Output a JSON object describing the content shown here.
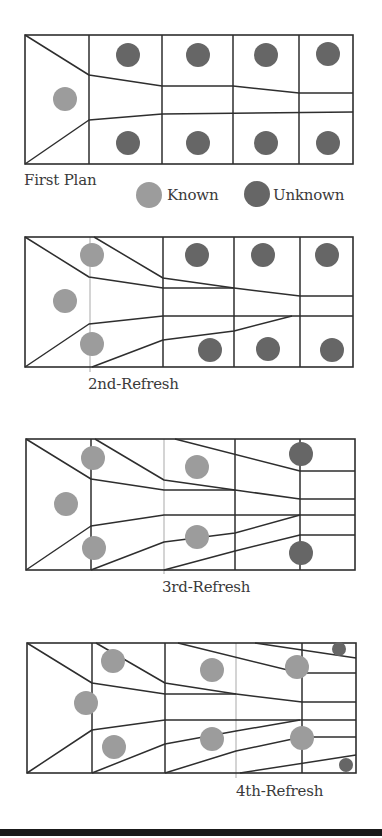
{
  "colors": {
    "known": "#9c9c9c",
    "unknown": "#666666",
    "line": "#2e2e2e",
    "guide": "#b8b8b8",
    "bar": "#1a1a1a"
  },
  "legend": {
    "known_label": "Known",
    "unknown_label": "Unknown"
  },
  "panels": [
    {
      "label": "First Plan",
      "label_pos": [
        24,
        171
      ],
      "box": [
        25,
        35,
        353,
        164
      ],
      "verticals": [
        89,
        162,
        233,
        299
      ],
      "guides": [],
      "lines": [
        [
          [
            25,
            35
          ],
          [
            89,
            75
          ],
          [
            162,
            86
          ],
          [
            233,
            86
          ],
          [
            299,
            93
          ],
          [
            353,
            93
          ]
        ],
        [
          [
            25,
            164
          ],
          [
            89,
            120
          ],
          [
            162,
            114
          ],
          [
            353,
            112
          ]
        ]
      ],
      "known": [
        [
          65,
          99,
          12
        ]
      ],
      "unknown": [
        [
          128,
          55,
          12
        ],
        [
          198,
          55,
          12
        ],
        [
          266,
          55,
          12
        ],
        [
          328,
          54,
          12
        ],
        [
          128,
          143,
          12
        ],
        [
          198,
          143,
          12
        ],
        [
          266,
          143,
          12
        ],
        [
          328,
          143,
          12
        ]
      ]
    },
    {
      "label": "2nd-Refresh",
      "label_pos": [
        88,
        375
      ],
      "box": [
        25,
        237,
        353,
        367
      ],
      "verticals": [
        163,
        234,
        300
      ],
      "guides": [
        [
          90,
          237,
          372
        ]
      ],
      "lines": [
        [
          [
            25,
            237
          ],
          [
            89,
            277
          ],
          [
            163,
            288
          ],
          [
            234,
            288
          ],
          [
            300,
            296
          ],
          [
            353,
            296
          ]
        ],
        [
          [
            94,
            237
          ],
          [
            163,
            278
          ],
          [
            234,
            288
          ]
        ],
        [
          [
            25,
            367
          ],
          [
            89,
            324
          ],
          [
            163,
            316
          ],
          [
            353,
            316
          ]
        ],
        [
          [
            92,
            367
          ],
          [
            163,
            340
          ],
          [
            234,
            331
          ],
          [
            292,
            316
          ]
        ]
      ],
      "known": [
        [
          92,
          255,
          12
        ],
        [
          65,
          301,
          12
        ],
        [
          92,
          344,
          12
        ]
      ],
      "unknown": [
        [
          197,
          255,
          12
        ],
        [
          263,
          255,
          12
        ],
        [
          327,
          255,
          12
        ],
        [
          210,
          350,
          12
        ],
        [
          268,
          349,
          12
        ],
        [
          332,
          350,
          12
        ]
      ]
    },
    {
      "label": "3rd-Refresh",
      "label_pos": [
        162,
        578
      ],
      "box": [
        26,
        439,
        355,
        570
      ],
      "verticals": [
        91,
        235,
        300
      ],
      "guides": [
        [
          164,
          439,
          574
        ]
      ],
      "lines": [
        [
          [
            26,
            439
          ],
          [
            91,
            479
          ],
          [
            164,
            490
          ],
          [
            235,
            490
          ],
          [
            300,
            499
          ],
          [
            355,
            499
          ]
        ],
        [
          [
            95,
            439
          ],
          [
            164,
            480
          ],
          [
            235,
            490
          ]
        ],
        [
          [
            175,
            439
          ],
          [
            300,
            471
          ],
          [
            355,
            471
          ]
        ],
        [
          [
            26,
            570
          ],
          [
            91,
            526
          ],
          [
            164,
            515
          ],
          [
            355,
            515
          ]
        ],
        [
          [
            91,
            570
          ],
          [
            164,
            542
          ],
          [
            235,
            533
          ],
          [
            300,
            515
          ]
        ],
        [
          [
            164,
            570
          ],
          [
            235,
            551
          ],
          [
            300,
            535
          ],
          [
            355,
            535
          ]
        ]
      ],
      "known": [
        [
          93,
          458,
          12
        ],
        [
          66,
          504,
          12
        ],
        [
          94,
          548,
          12
        ],
        [
          197,
          467,
          12
        ],
        [
          197,
          537,
          12
        ]
      ],
      "unknown": [
        [
          301,
          454,
          12
        ],
        [
          301,
          553,
          12
        ]
      ]
    },
    {
      "label": "4th-Refresh",
      "label_pos": [
        236,
        782
      ],
      "box": [
        27,
        643,
        356,
        773
      ],
      "verticals": [
        92,
        165,
        302
      ],
      "guides": [
        [
          236,
          643,
          778
        ]
      ],
      "lines": [
        [
          [
            27,
            643
          ],
          [
            92,
            683
          ],
          [
            165,
            694
          ],
          [
            236,
            694
          ],
          [
            302,
            702
          ],
          [
            356,
            702
          ]
        ],
        [
          [
            96,
            643
          ],
          [
            165,
            683
          ],
          [
            236,
            694
          ]
        ],
        [
          [
            178,
            643
          ],
          [
            300,
            673
          ],
          [
            356,
            673
          ]
        ],
        [
          [
            255,
            643
          ],
          [
            356,
            658
          ]
        ],
        [
          [
            27,
            773
          ],
          [
            92,
            730
          ],
          [
            165,
            720
          ],
          [
            356,
            720
          ]
        ],
        [
          [
            92,
            773
          ],
          [
            165,
            744
          ],
          [
            236,
            731
          ],
          [
            300,
            720
          ]
        ],
        [
          [
            165,
            773
          ],
          [
            236,
            751
          ],
          [
            302,
            737
          ],
          [
            356,
            737
          ]
        ],
        [
          [
            240,
            773
          ],
          [
            356,
            755
          ]
        ]
      ],
      "known": [
        [
          113,
          661,
          12
        ],
        [
          86,
          703,
          12
        ],
        [
          114,
          747,
          12
        ],
        [
          212,
          670,
          12
        ],
        [
          297,
          667,
          12
        ],
        [
          212,
          739,
          12
        ],
        [
          302,
          738,
          12
        ]
      ],
      "unknown": [
        [
          339,
          649,
          7
        ],
        [
          346,
          765,
          7
        ]
      ]
    }
  ],
  "legend_items": [
    {
      "kind": "known",
      "circle": [
        149,
        195,
        13
      ],
      "text_pos": [
        167,
        186
      ]
    },
    {
      "kind": "unknown",
      "circle": [
        257,
        194,
        13
      ],
      "text_pos": [
        273,
        186
      ]
    }
  ]
}
